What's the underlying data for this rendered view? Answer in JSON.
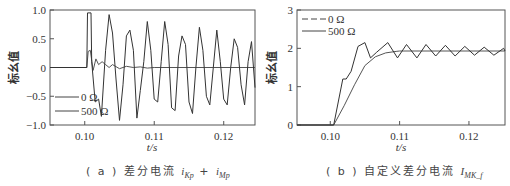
{
  "chart_data": [
    {
      "type": "line",
      "panel": "a",
      "caption_prefix": "( a ) 差分电流 ",
      "caption_var1": "i",
      "caption_sub1": "Kp",
      "caption_plus": " + ",
      "caption_var2": "i",
      "caption_sub2": "Mp",
      "xlabel": "t/s",
      "ylabel": "标幺值",
      "xlim": [
        0.095,
        0.1245
      ],
      "ylim": [
        -1.0,
        1.0
      ],
      "xticks": [
        "0.10",
        "0.11",
        "0.12"
      ],
      "yticks": [
        "1.0",
        "0.5",
        "0",
        "-0.5",
        "-1.0"
      ],
      "legend": [
        "0 Ω",
        "500 Ω"
      ],
      "legend_position": "lower-left",
      "series": [
        {
          "name": "0 Ω",
          "x": [
            0.095,
            0.1003,
            0.1005,
            0.1008,
            0.1012,
            0.1016,
            0.102,
            0.1025,
            0.103,
            0.1035,
            0.104,
            0.105,
            0.106,
            0.107,
            0.108,
            0.109,
            0.11,
            0.1245
          ],
          "y": [
            0,
            0,
            0.28,
            0.3,
            -0.05,
            0.15,
            0.05,
            0.1,
            0.05,
            0,
            0.05,
            -0.02,
            0.02,
            0,
            0.01,
            -0.01,
            0,
            0
          ]
        },
        {
          "name": "500 Ω",
          "x": [
            0.095,
            0.1003,
            0.1004,
            0.1009,
            0.101,
            0.1015,
            0.102,
            0.1024,
            0.103,
            0.1035,
            0.104,
            0.1045,
            0.105,
            0.1055,
            0.106,
            0.1065,
            0.107,
            0.1075,
            0.108,
            0.1085,
            0.109,
            0.1095,
            0.11,
            0.1105,
            0.111,
            0.1115,
            0.112,
            0.1125,
            0.113,
            0.1135,
            0.114,
            0.1145,
            0.115,
            0.1155,
            0.116,
            0.1165,
            0.117,
            0.1175,
            0.118,
            0.1185,
            0.119,
            0.1195,
            0.12,
            0.1205,
            0.121,
            0.1215,
            0.122,
            0.1225,
            0.123,
            0.1235,
            0.124,
            0.1245
          ],
          "y": [
            0,
            0,
            0.95,
            0.95,
            0.1,
            -0.6,
            -0.55,
            -0.85,
            0.3,
            0.92,
            0.6,
            -0.2,
            -0.92,
            -0.3,
            0.55,
            0.65,
            0.3,
            -0.88,
            -0.4,
            0.1,
            0.8,
            0.3,
            -0.55,
            -0.6,
            0.1,
            0.8,
            0.4,
            -0.7,
            -0.75,
            0.2,
            0.55,
            0.4,
            -0.6,
            -0.8,
            0.0,
            0.7,
            0.3,
            -0.5,
            -0.65,
            0.0,
            0.65,
            0.1,
            -0.55,
            -0.65,
            0.0,
            0.5,
            0.35,
            -0.3,
            -0.65,
            0.1,
            0.45,
            -0.35
          ]
        }
      ]
    },
    {
      "type": "line",
      "panel": "b",
      "caption_prefix": "( b ) 自定义差分电流 ",
      "caption_var1": "I",
      "caption_sub1": "MK_f",
      "xlabel": "t/s",
      "ylabel": "标幺值",
      "xlim": [
        0.0952,
        0.1252
      ],
      "ylim": [
        0,
        3
      ],
      "xticks": [
        "0.10",
        "0.11",
        "0.12"
      ],
      "yticks": [
        "3",
        "2",
        "1",
        "0"
      ],
      "legend": [
        "0 Ω",
        "500 Ω"
      ],
      "legend_position": "upper-left",
      "series": [
        {
          "name": "0 Ω",
          "x": [
            0.0952,
            0.1005,
            0.102,
            0.1035,
            0.105,
            0.1065,
            0.108,
            0.1095,
            0.11,
            0.1252
          ],
          "y": [
            0,
            0,
            0.5,
            1.05,
            1.55,
            1.78,
            1.88,
            1.92,
            1.93,
            1.93
          ]
        },
        {
          "name": "500 Ω",
          "x": [
            0.0952,
            0.1005,
            0.1018,
            0.1023,
            0.103,
            0.104,
            0.105,
            0.1058,
            0.1067,
            0.1083,
            0.1097,
            0.111,
            0.1125,
            0.1138,
            0.1152,
            0.1166,
            0.118,
            0.1194,
            0.1208,
            0.1222,
            0.1236,
            0.125,
            0.1252
          ],
          "y": [
            0,
            0,
            1.2,
            1.2,
            1.4,
            2.05,
            2.15,
            1.75,
            1.9,
            2.15,
            1.75,
            2.1,
            1.75,
            2.1,
            1.8,
            2.08,
            1.8,
            2.05,
            1.82,
            2.03,
            1.82,
            2.0,
            1.93
          ]
        }
      ]
    }
  ]
}
